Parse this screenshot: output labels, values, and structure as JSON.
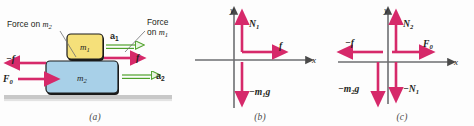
{
  "figure": {
    "background_color": "#fdfdfd"
  },
  "colors": {
    "force_arrow": "#d6296a",
    "accel_arrow": "#4fa12a",
    "accel_fill": "#eaf5e2",
    "block_m1_fill": "#f5e07a",
    "block_m1_stroke": "#1a1a1a",
    "block_m2_fill": "#a8d0e8",
    "block_m2_stroke": "#1a1a1a",
    "ground_fill": "#c8c8c8",
    "axis": "#6d6e71",
    "text": "#231f20"
  },
  "panels": [
    {
      "id": "a",
      "label": "(a)",
      "caption_left": {
        "line1": "Force on",
        "symbol": "m",
        "sub": "2"
      },
      "caption_right": {
        "line1": "Force",
        "line2_prefix": "on",
        "symbol": "m",
        "sub": "1"
      },
      "blocks": [
        {
          "name": "block-m1",
          "symbol": "m",
          "sub": "1"
        },
        {
          "name": "block-m2",
          "symbol": "m",
          "sub": "2"
        }
      ],
      "arrows": [
        {
          "name": "arrow-minus-f",
          "label": "−f",
          "kind": "force",
          "direction": "left"
        },
        {
          "name": "arrow-F0",
          "label": "F",
          "sub": "0",
          "kind": "force",
          "direction": "right"
        },
        {
          "name": "arrow-f",
          "label": "f",
          "kind": "force",
          "direction": "right"
        },
        {
          "name": "arrow-a1",
          "label": "a",
          "sub": "1",
          "kind": "acceleration",
          "direction": "right"
        },
        {
          "name": "arrow-a2",
          "label": "a",
          "sub": "2",
          "kind": "acceleration",
          "direction": "right"
        }
      ]
    },
    {
      "id": "b",
      "label": "(b)",
      "axis_x": "x",
      "axis_y": "y",
      "arrows": [
        {
          "name": "arrow-N1",
          "label": "N",
          "sub": "1",
          "direction": "up"
        },
        {
          "name": "arrow-f",
          "label": "f",
          "direction": "right"
        },
        {
          "name": "arrow-m1g",
          "label": "−m",
          "sub": "1",
          "suffix": "g",
          "direction": "down"
        }
      ]
    },
    {
      "id": "c",
      "label": "(c)",
      "axis_x": "x",
      "axis_y": "y",
      "arrows": [
        {
          "name": "arrow-N2",
          "label": "N",
          "sub": "2",
          "direction": "up"
        },
        {
          "name": "arrow-F0",
          "label": "F",
          "sub": "0",
          "direction": "right"
        },
        {
          "name": "arrow-minus-f",
          "label": "−f",
          "direction": "left"
        },
        {
          "name": "arrow-m2g",
          "label": "−m",
          "sub": "2",
          "suffix": "g",
          "direction": "down"
        },
        {
          "name": "arrow-minus-N1",
          "label": "−N",
          "sub": "1",
          "direction": "down"
        }
      ]
    }
  ]
}
